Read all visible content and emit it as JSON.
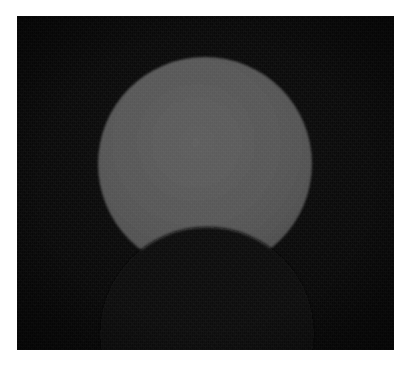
{
  "image": {
    "kind": "photograph",
    "subject": "partial-solar-eclipse",
    "caption": "Partial solar eclipse: the dark lunar disc intrudes on the lower portion of the bright solar disc.",
    "orientation": "landscape",
    "width_px": 411,
    "height_px": 368
  },
  "frame": {
    "name": "white-print-margin",
    "color": "#ffffff",
    "margin_left_px": 17,
    "margin_top_px": 16,
    "margin_right_px": 17,
    "margin_bottom_px": 18
  },
  "plate": {
    "name": "night-sky-plate",
    "left_px": 17,
    "top_px": 16,
    "width_px": 377,
    "height_px": 334,
    "sky_color": "#0b0b0b",
    "sky_color_highlight": "#131313",
    "sky_color_shadow": "#080808"
  },
  "bodies": [
    {
      "id": "sun",
      "label": "Sun",
      "shape": "circle",
      "center_x_px": 188,
      "center_y_px": 148,
      "radius_px": 107,
      "fill_color": "#575757",
      "limb_color": "#4a4a4a",
      "core_color": "#5d5d5d",
      "occluded": true
    },
    {
      "id": "moon",
      "label": "Moon",
      "shape": "circle",
      "center_x_px": 190,
      "center_y_px": 318,
      "radius_px": 107,
      "fill_color": "#090909",
      "occluding": true
    }
  ],
  "eclipse": {
    "type": "partial",
    "obscuration_label": "partial",
    "bite_direction": "from-below",
    "cusp_left_x_px": 116,
    "cusp_left_y_px": 239,
    "cusp_right_x_px": 260,
    "cusp_right_y_px": 236,
    "moon_limb_apex_x_px": 190,
    "moon_limb_apex_y_px": 211
  },
  "effects": {
    "grain": "film-grain",
    "grain_opacity": 0.5,
    "vignette": "corner-darkening",
    "vignette_strength": 0.55
  }
}
